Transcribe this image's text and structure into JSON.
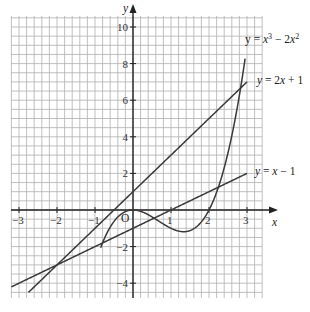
{
  "chart_data": {
    "type": "line",
    "title": "",
    "xlabel": "x",
    "ylabel": "y",
    "xlim": [
      -3.2,
      3.4
    ],
    "ylim": [
      -4.8,
      10.6
    ],
    "grid": true,
    "origin_label": "O",
    "x_ticks": [
      -3,
      -2,
      -1,
      1,
      2,
      3
    ],
    "x_tick_labels": [
      "−3",
      "−2",
      "−1",
      "1",
      "2",
      "3"
    ],
    "y_ticks": [
      10,
      8,
      6,
      4,
      2,
      -2,
      -4
    ],
    "y_tick_labels": [
      "10",
      "8",
      "6",
      "4",
      "2",
      "−2",
      "−4"
    ],
    "series": [
      {
        "name": "y = x³ − 2x²",
        "label_main": "y = x",
        "label_sup1": "3",
        "label_mid": " − 2x",
        "label_sup2": "2",
        "formula": "x^3-2x^2",
        "x_range": [
          -0.85,
          2.95
        ]
      },
      {
        "name": "y = 2x + 1",
        "label": "y = 2x + 1",
        "formula": "2x+1",
        "x_range": [
          -2.75,
          3.0
        ]
      },
      {
        "name": "y = x − 1",
        "label": "y = x − 1",
        "formula": "x-1",
        "x_range": [
          -3.2,
          3.0
        ]
      }
    ],
    "colors": {
      "grid": "#b0b0b0",
      "axis": "#222222",
      "curve": "#3a3a3a"
    }
  }
}
